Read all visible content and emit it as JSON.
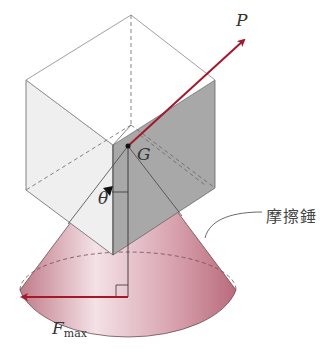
{
  "diagram": {
    "labels": {
      "force_p": "P",
      "center_g": "G",
      "angle": "θ",
      "friction_symbol": "F",
      "friction_subscript": "max",
      "cone_label": "摩擦錘"
    },
    "colors": {
      "arrow": "#a3182b",
      "cone_fill": "#c98a96",
      "cube_light_face": "#eeeeee",
      "cube_dark_face": "#a9a9a9",
      "line": "#555555"
    }
  }
}
